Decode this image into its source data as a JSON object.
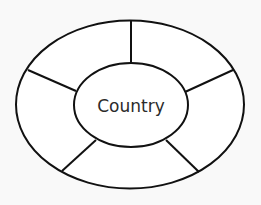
{
  "diagram": {
    "center_label": "Country",
    "outer_segments": 5,
    "stroke_color": "#111111",
    "background_color": "#f9f9f9"
  }
}
